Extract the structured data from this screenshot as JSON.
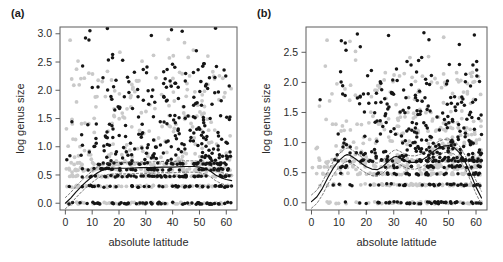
{
  "figure": {
    "width": 503,
    "height": 262,
    "background": "#ffffff"
  },
  "panels": [
    {
      "id": "a",
      "label": "(a)",
      "plot_box": {
        "x": 60,
        "y": 27,
        "width": 177,
        "height": 183
      },
      "colors": {
        "point_dark": "#151515",
        "point_light": "#c9c9c9",
        "curve": "#111111",
        "band": "#444444",
        "frame": "#5d5d5d"
      }
    },
    {
      "id": "b",
      "label": "(b)",
      "plot_box": {
        "x": 306,
        "y": 27,
        "width": 181,
        "height": 183
      },
      "colors": {
        "point_dark": "#151515",
        "point_light": "#c9c9c9",
        "curve": "#111111",
        "band": "#444444",
        "frame": "#5d5d5d"
      }
    }
  ],
  "chart_data": [
    {
      "panel": "a",
      "type": "scatter",
      "title": "(a)",
      "xlabel": "absolute latitude",
      "ylabel": "log genus size",
      "xlim": [
        -2,
        64
      ],
      "ylim": [
        -0.12,
        3.12
      ],
      "xticks": [
        0,
        10,
        20,
        30,
        40,
        50,
        60
      ],
      "xticklabels": [
        "0",
        "10",
        "20",
        "30",
        "40",
        "50",
        "60"
      ],
      "yticks": [
        0.0,
        0.5,
        1.0,
        1.5,
        2.0,
        2.5,
        3.0
      ],
      "yticklabels": [
        "0.0",
        "0.5",
        "1.0",
        "1.5",
        "2.0",
        "2.5",
        "3.0"
      ],
      "grid": false,
      "legend": "none",
      "series": [
        {
          "name": "background-points",
          "color": "#c9c9c9",
          "marker": "circle",
          "n": 520,
          "seed": 1347,
          "x_range": [
            0,
            62
          ],
          "y_levels": [
            0.0,
            0.3,
            0.48,
            0.6,
            0.7
          ],
          "y_level_weight": 0.55,
          "y_cloud_range": [
            0.55,
            2.35
          ],
          "x_bias": "uniform"
        },
        {
          "name": "focal-points",
          "color": "#151515",
          "marker": "circle",
          "n": 470,
          "seed": 9021,
          "x_range": [
            0,
            62
          ],
          "y_levels": [
            0.0,
            0.3,
            0.48,
            0.6,
            0.7
          ],
          "y_level_weight": 0.52,
          "y_cloud_range": [
            0.75,
            2.55
          ],
          "x_bias": "mid-high"
        }
      ],
      "annotations": [
        {
          "text": "sparse high points near 2.8-3.05 between latitude 22 and 45"
        },
        {
          "text": "dense horizontal bands at y = 0.00, 0.30, 0.48, 0.60, 0.70"
        }
      ],
      "loess": {
        "name": "loess-fit",
        "points": [
          [
            0,
            0.0
          ],
          [
            2,
            0.09
          ],
          [
            4,
            0.2
          ],
          [
            6,
            0.3
          ],
          [
            8,
            0.39
          ],
          [
            10,
            0.47
          ],
          [
            12,
            0.54
          ],
          [
            14,
            0.59
          ],
          [
            16,
            0.61
          ],
          [
            18,
            0.62
          ],
          [
            20,
            0.62
          ],
          [
            24,
            0.62
          ],
          [
            28,
            0.63
          ],
          [
            32,
            0.63
          ],
          [
            36,
            0.64
          ],
          [
            40,
            0.64
          ],
          [
            44,
            0.65
          ],
          [
            48,
            0.65
          ],
          [
            50,
            0.64
          ],
          [
            52,
            0.62
          ],
          [
            54,
            0.57
          ],
          [
            56,
            0.5
          ],
          [
            58,
            0.45
          ],
          [
            60,
            0.42
          ],
          [
            62,
            0.4
          ]
        ],
        "band_offset": 0.1
      }
    },
    {
      "panel": "b",
      "type": "scatter",
      "title": "(b)",
      "xlabel": "absolute latitude",
      "ylabel": "log genus size",
      "xlim": [
        -2,
        64
      ],
      "ylim": [
        -0.12,
        2.92
      ],
      "xticks": [
        0,
        10,
        20,
        30,
        40,
        50,
        60
      ],
      "xticklabels": [
        "0",
        "10",
        "20",
        "30",
        "40",
        "50",
        "60"
      ],
      "yticks": [
        0.0,
        0.5,
        1.0,
        1.5,
        2.0,
        2.5
      ],
      "yticklabels": [
        "0.0",
        "0.5",
        "1.0",
        "1.5",
        "2.0",
        "2.5"
      ],
      "grid": false,
      "legend": "none",
      "series": [
        {
          "name": "background-points",
          "color": "#c9c9c9",
          "marker": "circle",
          "n": 560,
          "seed": 4412,
          "x_range": [
            0,
            62
          ],
          "y_levels": [
            0.0,
            0.3,
            0.48,
            0.6,
            0.7
          ],
          "y_level_weight": 0.5,
          "y_cloud_range": [
            0.55,
            2.2
          ],
          "x_bias": "mid-high"
        },
        {
          "name": "focal-points",
          "color": "#151515",
          "marker": "circle",
          "n": 430,
          "seed": 7733,
          "x_range": [
            0,
            62
          ],
          "y_levels": [
            0.0,
            0.3,
            0.48,
            0.6,
            0.7
          ],
          "y_level_weight": 0.48,
          "y_cloud_range": [
            0.7,
            2.3
          ],
          "x_bias": "high"
        }
      ],
      "annotations": [
        {
          "text": "dense dark cluster between latitude 42 and 58 at y = 0.9-1.8"
        },
        {
          "text": "isolated high point near latitude 34 at y = 2.80"
        }
      ],
      "loess": {
        "points": [
          [
            0,
            0.02
          ],
          [
            2,
            0.1
          ],
          [
            4,
            0.24
          ],
          [
            6,
            0.42
          ],
          [
            8,
            0.58
          ],
          [
            10,
            0.7
          ],
          [
            12,
            0.78
          ],
          [
            13,
            0.8
          ],
          [
            14,
            0.79
          ],
          [
            16,
            0.73
          ],
          [
            18,
            0.66
          ],
          [
            20,
            0.6
          ],
          [
            22,
            0.56
          ],
          [
            24,
            0.55
          ],
          [
            26,
            0.6
          ],
          [
            28,
            0.69
          ],
          [
            30,
            0.76
          ],
          [
            31,
            0.77
          ],
          [
            32,
            0.75
          ],
          [
            34,
            0.7
          ],
          [
            36,
            0.67
          ],
          [
            38,
            0.67
          ],
          [
            40,
            0.7
          ],
          [
            42,
            0.76
          ],
          [
            44,
            0.84
          ],
          [
            46,
            0.9
          ],
          [
            48,
            0.94
          ],
          [
            50,
            0.95
          ],
          [
            52,
            0.92
          ],
          [
            54,
            0.83
          ],
          [
            56,
            0.68
          ],
          [
            58,
            0.48
          ],
          [
            60,
            0.26
          ],
          [
            62,
            0.08
          ]
        ],
        "band_offset": 0.11
      }
    }
  ]
}
